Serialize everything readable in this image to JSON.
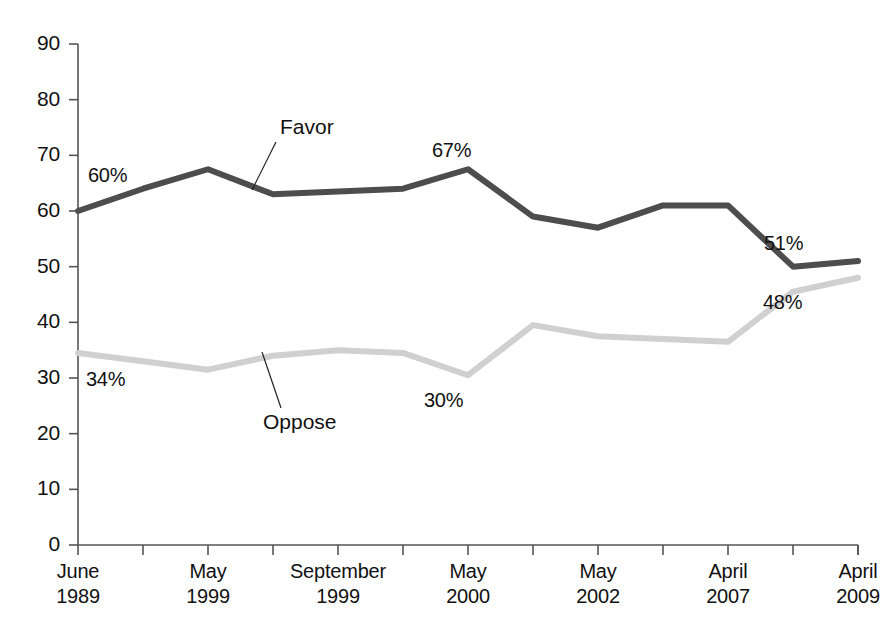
{
  "chart_data": {
    "type": "line",
    "title": "",
    "subtitle": "",
    "xlabel": "",
    "ylabel": "",
    "ylim": [
      0,
      90
    ],
    "ytick_values": [
      0,
      10,
      20,
      30,
      40,
      50,
      60,
      70,
      80,
      90
    ],
    "ytick_labels": [
      "0",
      "10",
      "20",
      "30",
      "40",
      "50",
      "60",
      "70",
      "80",
      "90"
    ],
    "grid": false,
    "legend_position": "inline-annotations",
    "x_count": 13,
    "categories": [
      "June 1989",
      "",
      "May 1999",
      "",
      "September 1999",
      "",
      "May 2000",
      "",
      "May 2002",
      "",
      "April 2007",
      "",
      "April 2009"
    ],
    "xtick_labels": [
      {
        "index": 0,
        "line1": "June",
        "line2": "1989"
      },
      {
        "index": 2,
        "line1": "May",
        "line2": "1999"
      },
      {
        "index": 4,
        "line1": "September",
        "line2": "1999"
      },
      {
        "index": 6,
        "line1": "May",
        "line2": "2000"
      },
      {
        "index": 8,
        "line1": "May",
        "line2": "2002"
      },
      {
        "index": 10,
        "line1": "April",
        "line2": "2007"
      },
      {
        "index": 12,
        "line1": "April",
        "line2": "2009"
      }
    ],
    "series": [
      {
        "name": "Favor",
        "color": "#4d4d4d",
        "values": [
          60,
          64,
          67.5,
          63,
          63.5,
          64,
          67.5,
          59,
          57,
          61,
          61,
          50,
          51
        ]
      },
      {
        "name": "Oppose",
        "color": "#d0d0d0",
        "values": [
          34.5,
          33,
          31.5,
          34,
          35,
          34.5,
          30.5,
          39.5,
          37.5,
          37,
          36.5,
          45.5,
          48
        ]
      }
    ],
    "annotations": [
      {
        "text": "60%",
        "series": "Favor",
        "point_index": 0,
        "x": 88,
        "y": 164
      },
      {
        "text": "67%",
        "series": "Favor",
        "point_index": 6,
        "x": 432,
        "y": 139
      },
      {
        "text": "51%",
        "series": "Favor",
        "point_index": 12,
        "x": 764,
        "y": 232
      },
      {
        "text": "34%",
        "series": "Oppose",
        "point_index": 0,
        "x": 86,
        "y": 368
      },
      {
        "text": "30%",
        "series": "Oppose",
        "point_index": 6,
        "x": 424,
        "y": 389
      },
      {
        "text": "48%",
        "series": "Oppose",
        "point_index": 12,
        "x": 763,
        "y": 291
      }
    ],
    "series_callouts": [
      {
        "label": "Favor",
        "label_x": 280,
        "label_y": 115,
        "leader_from_x": 276,
        "leader_from_y": 142,
        "leader_to_x": 252,
        "leader_to_y": 190
      },
      {
        "label": "Oppose",
        "label_x": 263,
        "label_y": 410,
        "leader_from_x": 281,
        "leader_from_y": 408,
        "leader_to_x": 262,
        "leader_to_y": 352
      }
    ],
    "axis_color": "#555555",
    "plot_left": 78,
    "plot_right": 858,
    "plot_top": 44,
    "plot_bottom": 545
  }
}
